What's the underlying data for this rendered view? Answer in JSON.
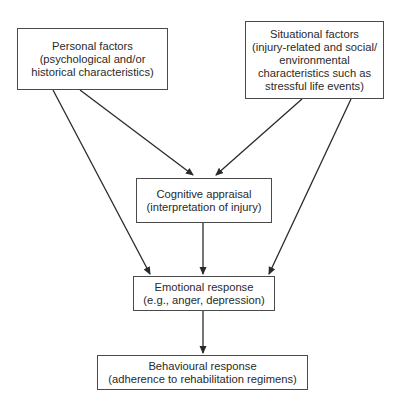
{
  "diagram": {
    "nodes": {
      "personal": {
        "lines": [
          "Personal factors",
          "(psychological and/or",
          "historical characteristics)"
        ]
      },
      "situational": {
        "lines": [
          "Situational factors",
          "(injury-related and social/",
          "environmental",
          "characteristics such as",
          "stressful life events)"
        ]
      },
      "cognitive": {
        "lines": [
          "Cognitive appraisal",
          "(interpretation of injury)"
        ]
      },
      "emotional": {
        "lines": [
          "Emotional response",
          "(e.g., anger, depression)"
        ]
      },
      "behavioural": {
        "lines": [
          "Behavioural response",
          "(adherence to rehabilitation regimens)"
        ]
      }
    },
    "edges": [
      {
        "from": "personal",
        "to": "cognitive"
      },
      {
        "from": "personal",
        "to": "emotional"
      },
      {
        "from": "situational",
        "to": "cognitive"
      },
      {
        "from": "situational",
        "to": "emotional"
      },
      {
        "from": "cognitive",
        "to": "emotional"
      },
      {
        "from": "emotional",
        "to": "behavioural"
      }
    ]
  }
}
